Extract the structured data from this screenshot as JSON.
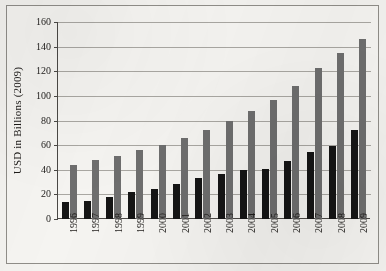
{
  "figure": {
    "background_color": "#f5f4f1",
    "frame_color": "#8f8d88"
  },
  "chart_data": {
    "type": "bar",
    "title": "",
    "subtitle": "",
    "xlabel": "",
    "ylabel": "USD in Billions (2009)",
    "categories": [
      "1996",
      "1997",
      "1998",
      "1999",
      "2000",
      "2001",
      "2002",
      "2003",
      "2004",
      "2005",
      "2006",
      "2007",
      "2008",
      "2009"
    ],
    "series": [
      {
        "name": "dark-series",
        "color": "#151515",
        "values": [
          14,
          15,
          18,
          22,
          24,
          28.5,
          33.5,
          36.5,
          39.5,
          41,
          47.5,
          54.5,
          59,
          72
        ]
      },
      {
        "name": "gray-series",
        "color": "#6e6e6e",
        "values": [
          43.5,
          48,
          51.5,
          56,
          60.5,
          66,
          72.5,
          79.5,
          87.5,
          97,
          108,
          123,
          135,
          146.5
        ]
      }
    ],
    "ylim": [
      0,
      160
    ],
    "ytick_values": [
      0,
      20,
      40,
      60,
      80,
      100,
      120,
      140,
      160
    ],
    "ytick_labels": [
      "0",
      "20",
      "40",
      "60",
      "80",
      "100",
      "120",
      "140",
      "160"
    ],
    "grid": true,
    "grid_axis": "y",
    "legend": false,
    "legend_position": "none",
    "annotations": []
  }
}
